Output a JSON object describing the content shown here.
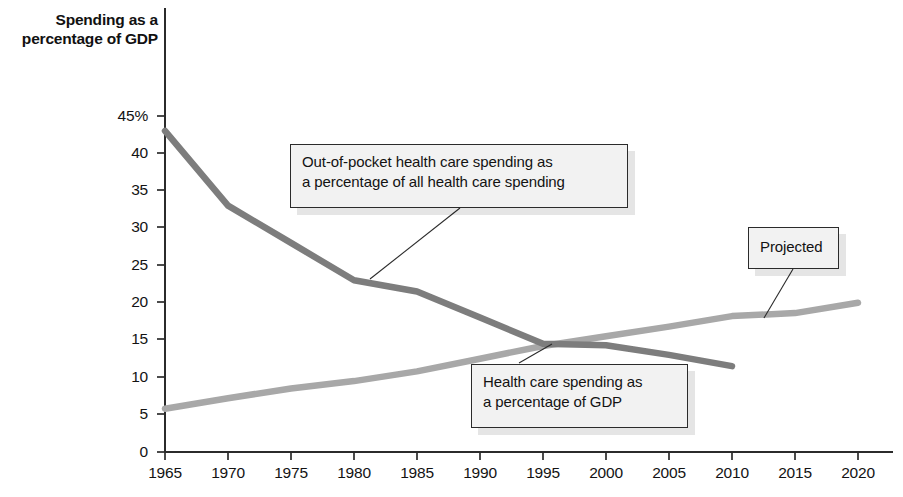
{
  "axis_title": "Spending as a\npercentage\nof GDP",
  "callouts": {
    "out_of_pocket": "Out-of-pocket health care spending as\na percentage of all health care spending",
    "gdp": "Health care spending as\na percentage of GDP",
    "projected": "Projected"
  },
  "colors": {
    "series_out_of_pocket": "#7d7d7d",
    "series_gdp": "#a8a8a8",
    "axis": "#2b2b2b",
    "callout_fill": "#f2f2f2",
    "callout_border": "#2b2b2b"
  },
  "chart_data": {
    "type": "line",
    "title": "Spending as a percentage of GDP",
    "xlabel": "",
    "ylabel": "Spending as a percentage of GDP",
    "xlim": [
      1965,
      2020
    ],
    "ylim": [
      0,
      45
    ],
    "grid": false,
    "legend_position": "none",
    "x": [
      1965,
      1970,
      1975,
      1980,
      1985,
      1990,
      1995,
      2000,
      2005,
      2010,
      2015,
      2020
    ],
    "xticklabels": [
      "1965",
      "1970",
      "1975",
      "1980",
      "1985",
      "1990",
      "1995",
      "2000",
      "2005",
      "2010",
      "2015",
      "2020"
    ],
    "yticks": [
      0,
      5,
      10,
      15,
      20,
      25,
      30,
      35,
      40,
      45
    ],
    "yticklabels": [
      "0",
      "5",
      "10",
      "15",
      "20",
      "25",
      "30",
      "35",
      "40",
      "45%"
    ],
    "series": [
      {
        "name": "Out-of-pocket health care spending as a percentage of all health care spending",
        "color": "#7d7d7d",
        "x": [
          1965,
          1970,
          1975,
          1980,
          1985,
          1990,
          1995,
          2000,
          2005,
          2010
        ],
        "values": [
          43.0,
          33.0,
          28.0,
          23.0,
          21.5,
          18.0,
          14.5,
          14.3,
          13.0,
          11.5
        ]
      },
      {
        "name": "Health care spending as a percentage of GDP",
        "color": "#a8a8a8",
        "x": [
          1965,
          1970,
          1975,
          1980,
          1985,
          1990,
          1995,
          2000,
          2005,
          2010,
          2015,
          2020
        ],
        "values": [
          5.8,
          7.2,
          8.5,
          9.5,
          10.8,
          12.5,
          14.2,
          15.5,
          16.8,
          18.2,
          18.6,
          20.0
        ]
      }
    ],
    "annotations": [
      {
        "text": "Out-of-pocket health care spending as a percentage of all health care spending",
        "points_to_series": "out_of_pocket",
        "points_to_x": 1980
      },
      {
        "text": "Health care spending as a percentage of GDP",
        "points_to_series": "gdp",
        "points_to_x": 1993
      },
      {
        "text": "Projected",
        "points_to_series": "gdp",
        "points_to_x": 2012
      }
    ]
  }
}
